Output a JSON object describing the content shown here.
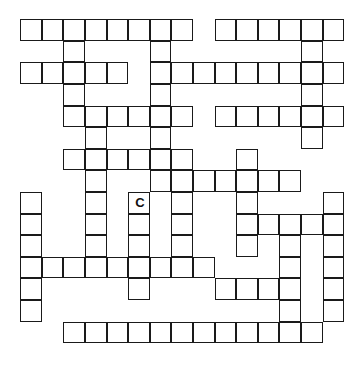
{
  "puzzle": {
    "type": "crossword",
    "rows": 15,
    "cols": 15,
    "line_color": "#1a1a1a",
    "background": "#ffffff",
    "cells_by_row": [
      [
        0,
        1,
        2,
        3,
        4,
        5,
        6,
        7,
        9,
        10,
        11,
        12,
        13,
        14
      ],
      [
        2,
        6,
        13
      ],
      [
        0,
        1,
        2,
        3,
        4,
        6,
        7,
        8,
        9,
        10,
        11,
        12,
        13,
        14
      ],
      [
        2,
        6,
        13
      ],
      [
        2,
        3,
        4,
        5,
        6,
        7,
        9,
        10,
        11,
        12,
        13,
        14
      ],
      [
        3,
        6,
        13
      ],
      [
        2,
        3,
        4,
        5,
        6,
        7,
        10
      ],
      [
        3,
        6,
        7,
        8,
        9,
        10,
        11,
        12
      ],
      [
        0,
        3,
        5,
        7,
        10,
        14
      ],
      [
        0,
        3,
        5,
        7,
        10,
        11,
        12,
        13,
        14
      ],
      [
        0,
        3,
        5,
        7,
        10,
        12,
        14
      ],
      [
        0,
        1,
        2,
        3,
        4,
        5,
        6,
        7,
        8,
        12,
        14
      ],
      [
        0,
        5,
        9,
        10,
        11,
        12,
        14
      ],
      [
        0,
        12,
        14
      ],
      [
        2,
        3,
        4,
        5,
        6,
        7,
        8,
        9,
        10,
        11,
        12,
        13
      ]
    ],
    "filled_letters": [
      {
        "row": 8,
        "col": 5,
        "letter": "C"
      }
    ]
  }
}
